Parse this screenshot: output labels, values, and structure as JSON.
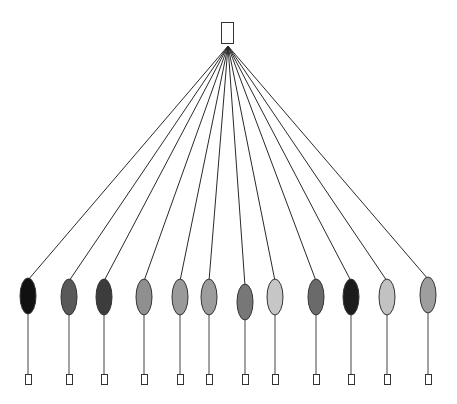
{
  "diagram": {
    "type": "tree",
    "root": {
      "x": 221,
      "y": 22,
      "w": 12,
      "h": 21,
      "fill": "#ffffff",
      "stroke": "#333333",
      "hub_x": 228,
      "hub_y": 46
    },
    "leaf_box": {
      "w": 6,
      "h": 10,
      "y": 374,
      "stroke": "#333333",
      "fill": "#ffffff"
    },
    "nodes": [
      {
        "id": 1,
        "cx": 28,
        "cy": 296,
        "rx": 8,
        "ry": 18,
        "fill": "#111111"
      },
      {
        "id": 2,
        "cx": 69,
        "cy": 297,
        "rx": 8,
        "ry": 18,
        "fill": "#595959"
      },
      {
        "id": 3,
        "cx": 104,
        "cy": 297,
        "rx": 8,
        "ry": 18,
        "fill": "#3c3c3c"
      },
      {
        "id": 4,
        "cx": 144,
        "cy": 297,
        "rx": 8,
        "ry": 18,
        "fill": "#8f8f8f"
      },
      {
        "id": 5,
        "cx": 180,
        "cy": 297,
        "rx": 8,
        "ry": 18,
        "fill": "#9a9a9a"
      },
      {
        "id": 6,
        "cx": 209,
        "cy": 297,
        "rx": 8,
        "ry": 18,
        "fill": "#9c9c9c"
      },
      {
        "id": 7,
        "cx": 245,
        "cy": 302,
        "rx": 8,
        "ry": 18,
        "fill": "#777777"
      },
      {
        "id": 8,
        "cx": 275,
        "cy": 297,
        "rx": 8,
        "ry": 18,
        "fill": "#c6c6c6"
      },
      {
        "id": 9,
        "cx": 316,
        "cy": 297,
        "rx": 8,
        "ry": 18,
        "fill": "#6a6a6a"
      },
      {
        "id": 10,
        "cx": 351,
        "cy": 297,
        "rx": 8,
        "ry": 18,
        "fill": "#1c1c1c"
      },
      {
        "id": 11,
        "cx": 387,
        "cy": 297,
        "rx": 8,
        "ry": 18,
        "fill": "#c2c2c2"
      },
      {
        "id": 12,
        "cx": 428,
        "cy": 295,
        "rx": 8,
        "ry": 18,
        "fill": "#9e9e9e"
      }
    ]
  }
}
